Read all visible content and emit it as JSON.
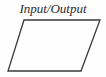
{
  "diagram": {
    "type": "flowchart-symbol",
    "symbol_name": "parallelogram",
    "caption": "Input/Output",
    "colors": {
      "background": "#fefefe",
      "stroke": "#3a3a3a",
      "text": "#2b2b2b",
      "fill": "none"
    },
    "geometry": {
      "points": "24,20 100,20 81,71 8,71",
      "top_left": [
        24,
        20
      ],
      "top_right": [
        100,
        20
      ],
      "bottom_right": [
        81,
        71
      ],
      "bottom_left": [
        8,
        71
      ],
      "stroke_width": 1.3
    }
  }
}
